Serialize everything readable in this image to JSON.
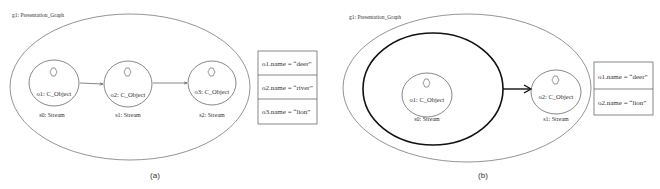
{
  "panels": [
    {
      "id": "a",
      "graph_label": "g1: Presentation_Graph",
      "caption": "(a)",
      "streams": [
        {
          "object": "o1: C_Object",
          "stream": "s0: Stream"
        },
        {
          "object": "o2: C_Object",
          "stream": "s1: Stream"
        },
        {
          "object": "o3: C_Object",
          "stream": "s2: Stream"
        }
      ],
      "table": [
        "o1.name = “deer”",
        "o2.name = “river”",
        "o3.name = “lion”"
      ]
    },
    {
      "id": "b",
      "graph_label": "g1: Presentation_Graph",
      "caption": "(b)",
      "streams": [
        {
          "object": "o1: C_Object",
          "stream": "s0: Stream"
        },
        {
          "object": "o2: C_Object",
          "stream": "s1: Stream"
        }
      ],
      "table": [
        "o1.name = “deer”",
        "o2.name = “lion”"
      ]
    }
  ]
}
